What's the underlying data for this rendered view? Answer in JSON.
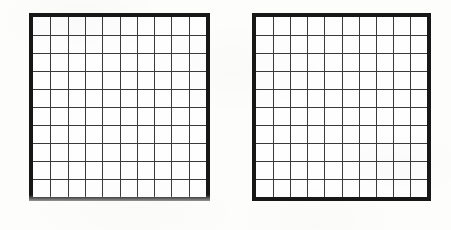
{
  "page": {
    "width": 451,
    "height": 230,
    "background_color": "#fdfdfc",
    "medium": "scanned-document"
  },
  "figures": [
    {
      "id": "left-grid",
      "name": "Empty 10 by 10 grid (left)",
      "columns": 10,
      "rows": 10,
      "cells_filled": 0,
      "labels": [],
      "bounds": {
        "x": 29,
        "y": 13,
        "width": 181,
        "height": 188
      },
      "border_width": 4,
      "border_color": "#171717",
      "inner_line_width": 1,
      "inner_line_color": "#3a3a3a",
      "cell_fill": "#fefefe",
      "bottom_edge_faded": true
    },
    {
      "id": "right-grid",
      "name": "Empty 10 by 10 grid (right)",
      "columns": 10,
      "rows": 10,
      "cells_filled": 0,
      "labels": [],
      "bounds": {
        "x": 252,
        "y": 13,
        "width": 179,
        "height": 188
      },
      "border_width": 4,
      "border_color": "#171717",
      "inner_line_width": 1,
      "inner_line_color": "#3a3a3a",
      "cell_fill": "#fefefe",
      "bottom_edge_faded": false
    }
  ]
}
